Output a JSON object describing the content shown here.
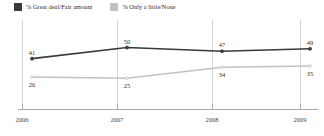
{
  "chart_data": {
    "type": "line",
    "title": "",
    "xlabel": "",
    "ylabel": "",
    "categories": [
      "2006",
      "2007",
      "2008",
      "2009"
    ],
    "series": [
      {
        "name": "% Great deal/Fair amount",
        "color": "#3a3a3a",
        "values": [
          41,
          50,
          47,
          49
        ]
      },
      {
        "name": "% Only a little/None",
        "color": "#c2c2c2",
        "values": [
          26,
          25,
          34,
          35
        ]
      }
    ],
    "ylim": [
      0,
      70
    ],
    "grid": "vertical",
    "legend_position": "top-left",
    "annotations": "Data labels shown above dark series points and below light series points"
  },
  "legend": {
    "items": [
      {
        "label": "% Great deal/Fair amount",
        "color": "#3a3a3a"
      },
      {
        "label": "% Only a little/None",
        "color": "#c2c2c2"
      }
    ]
  },
  "axis": {
    "ticks": [
      "2006",
      "2007",
      "2008",
      "2009"
    ]
  },
  "labels": {
    "dark": [
      "41",
      "50",
      "47",
      "49"
    ],
    "light": [
      "26",
      "25",
      "34",
      "35"
    ]
  }
}
